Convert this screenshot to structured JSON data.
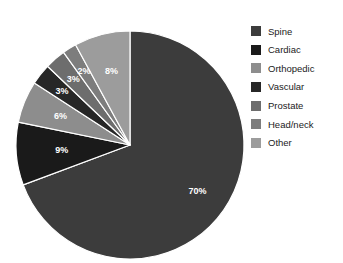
{
  "chart_data": {
    "type": "pie",
    "title": "",
    "categories": [
      "Spine",
      "Cardiac",
      "Orthopedic",
      "Vascular",
      "Prostate",
      "Head/neck",
      "Other"
    ],
    "values": [
      70,
      9,
      6,
      3,
      3,
      2,
      8
    ],
    "value_unit": "%",
    "data_labels": [
      "70%",
      "9%",
      "6%",
      "3%",
      "3%",
      "2%",
      "8%"
    ],
    "colors": [
      "#3c3c3c",
      "#1a1a1a",
      "#8d8d8d",
      "#272727",
      "#6d6d6d",
      "#7d7d7d",
      "#9c9c9c"
    ],
    "start_angle_deg": 0,
    "direction": "clockwise",
    "legend_position": "right",
    "grid": false
  },
  "legend": {
    "items": [
      {
        "label": "Spine",
        "color": "#3c3c3c",
        "value": "70%"
      },
      {
        "label": "Cardiac",
        "color": "#1a1a1a",
        "value": "9%"
      },
      {
        "label": "Orthopedic",
        "color": "#8d8d8d",
        "value": "6%"
      },
      {
        "label": "Vascular",
        "color": "#272727",
        "value": "3%"
      },
      {
        "label": "Prostate",
        "color": "#6d6d6d",
        "value": "3%"
      },
      {
        "label": "Head/neck",
        "color": "#7d7d7d",
        "value": "2%"
      },
      {
        "label": "Other",
        "color": "#9c9c9c",
        "value": "8%"
      }
    ]
  },
  "pie": {
    "center_x": 130,
    "center_y": 145,
    "radius": 114,
    "separator_color": "#ffffff",
    "separator_width": 1.2,
    "label_color": "#ffffff"
  },
  "background": "#ffffff"
}
